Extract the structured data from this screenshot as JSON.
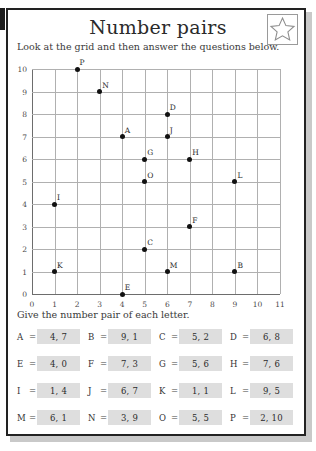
{
  "page": {
    "title": "Number pairs",
    "instruction_top": "Look at the grid and then answer the questions below.",
    "instruction_bottom": "Give the number pair of each letter.",
    "star_icon": "star-outline-icon"
  },
  "chart_data": {
    "type": "scatter",
    "title": "Number pairs",
    "xlabel": "",
    "ylabel": "",
    "xlim": [
      0,
      11
    ],
    "ylim": [
      0,
      10
    ],
    "grid": true,
    "legend": "none",
    "x_ticks": [
      0,
      1,
      2,
      3,
      4,
      5,
      6,
      7,
      8,
      9,
      10,
      11
    ],
    "y_ticks": [
      0,
      1,
      2,
      3,
      4,
      5,
      6,
      7,
      8,
      9,
      10
    ],
    "points": [
      {
        "label": "A",
        "x": 4,
        "y": 7
      },
      {
        "label": "B",
        "x": 9,
        "y": 1
      },
      {
        "label": "C",
        "x": 5,
        "y": 2
      },
      {
        "label": "D",
        "x": 6,
        "y": 8
      },
      {
        "label": "E",
        "x": 4,
        "y": 0
      },
      {
        "label": "F",
        "x": 7,
        "y": 3
      },
      {
        "label": "G",
        "x": 5,
        "y": 6
      },
      {
        "label": "H",
        "x": 7,
        "y": 6
      },
      {
        "label": "I",
        "x": 1,
        "y": 4
      },
      {
        "label": "J",
        "x": 6,
        "y": 7
      },
      {
        "label": "K",
        "x": 1,
        "y": 1
      },
      {
        "label": "L",
        "x": 9,
        "y": 5
      },
      {
        "label": "M",
        "x": 6,
        "y": 1
      },
      {
        "label": "N",
        "x": 3,
        "y": 9
      },
      {
        "label": "O",
        "x": 5,
        "y": 5
      },
      {
        "label": "P",
        "x": 2,
        "y": 10
      }
    ]
  },
  "answers": {
    "equals": "=",
    "rows": [
      [
        {
          "letter": "A",
          "value": "4, 7"
        },
        {
          "letter": "B",
          "value": "9, 1"
        },
        {
          "letter": "C",
          "value": "5, 2"
        },
        {
          "letter": "D",
          "value": "6, 8"
        }
      ],
      [
        {
          "letter": "E",
          "value": "4, 0"
        },
        {
          "letter": "F",
          "value": "7, 3"
        },
        {
          "letter": "G",
          "value": "5, 6"
        },
        {
          "letter": "H",
          "value": "7, 6"
        }
      ],
      [
        {
          "letter": "I",
          "value": "1, 4"
        },
        {
          "letter": "J",
          "value": "6, 7"
        },
        {
          "letter": "K",
          "value": "1, 1"
        },
        {
          "letter": "L",
          "value": "9, 5"
        }
      ],
      [
        {
          "letter": "M",
          "value": "6, 1"
        },
        {
          "letter": "N",
          "value": "3, 9"
        },
        {
          "letter": "O",
          "value": "5, 5"
        },
        {
          "letter": "P",
          "value": "2, 10"
        }
      ]
    ]
  },
  "colors": {
    "grid_line": "#b0b0b0",
    "axis_line": "#6d6d6d",
    "point": "#111111",
    "answer_box": "#dedede",
    "page_border": "#222222"
  }
}
